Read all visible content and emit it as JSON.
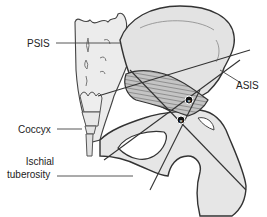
{
  "figure": {
    "labels": {
      "psis": "PSIS",
      "asis": "ASIS",
      "coccyx": "Coccyx",
      "ischial_line1": "Ischial",
      "ischial_line2": "tuberosity"
    },
    "markers": [
      {
        "name": "marker-upper",
        "x": 189,
        "y": 100
      },
      {
        "name": "marker-lower",
        "x": 181,
        "y": 120
      }
    ],
    "colors": {
      "bone_fill": "#e6e6e6",
      "sacrum_fill": "#ececec",
      "outline": "#333333",
      "muscle_fill": "#bdbdbd",
      "muscle_stripe": "#7a7a7a",
      "leader_line": "#444444",
      "marker": "#111111"
    }
  }
}
